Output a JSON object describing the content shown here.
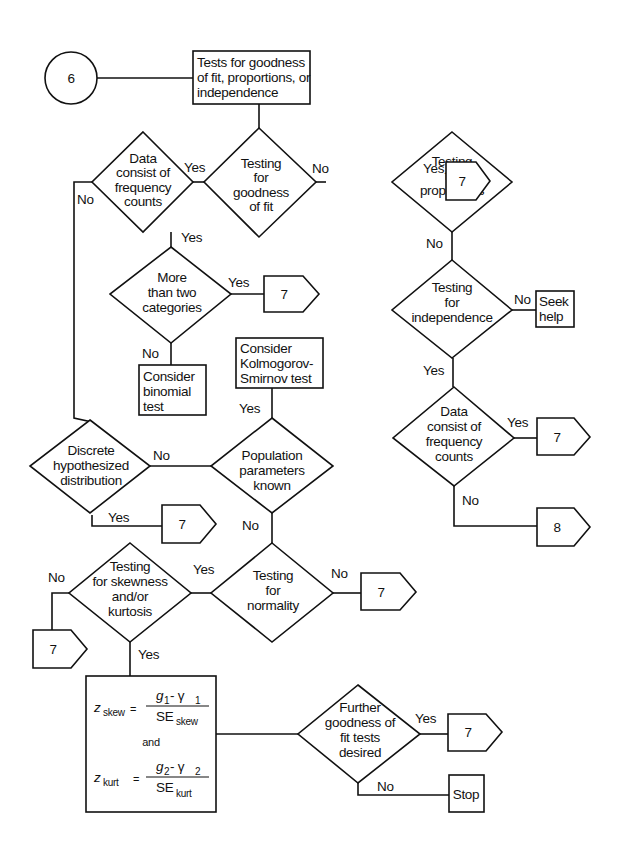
{
  "diagram": {
    "start_connector": {
      "label": "6"
    },
    "title_box": {
      "lines": [
        "Tests for goodness",
        "of fit, proportions, or",
        "independence"
      ]
    },
    "nodes": {
      "goodness_of_fit": {
        "lines": [
          "Testing",
          "for",
          "goodness",
          "of fit"
        ]
      },
      "freq_counts_left": {
        "lines": [
          "Data",
          "consist of",
          "frequency",
          "counts"
        ]
      },
      "proportions": {
        "lines": [
          "Testing",
          "for",
          "proportions"
        ]
      },
      "more_than_two": {
        "lines": [
          "More",
          "than two",
          "categories"
        ]
      },
      "binomial": {
        "lines": [
          "Consider",
          "binomial",
          "test"
        ]
      },
      "ks_test": {
        "lines": [
          "Consider",
          "Kolmogorov-",
          "Smirnov test"
        ]
      },
      "population_known": {
        "lines": [
          "Population",
          "parameters",
          "known"
        ]
      },
      "discrete": {
        "lines": [
          "Discrete",
          "hypothesized",
          "distribution"
        ]
      },
      "independence": {
        "lines": [
          "Testing",
          "for",
          "independence"
        ]
      },
      "seek_help": {
        "lines": [
          "Seek",
          "help"
        ]
      },
      "freq_counts_right": {
        "lines": [
          "Data",
          "consist of",
          "frequency",
          "counts"
        ]
      },
      "normality": {
        "lines": [
          "Testing",
          "for",
          "normality"
        ]
      },
      "skew_kurt": {
        "lines": [
          "Testing",
          "for skewness",
          "and/or",
          "kurtosis"
        ]
      },
      "formula": {
        "z_skew": {
          "lhs": "z",
          "lhs_sub": "skew",
          "num": "g",
          "num_sub": "1",
          "num_rest": " - γ",
          "num_rest_sub": "1",
          "den": "SE",
          "den_sub": "skew"
        },
        "and": "and",
        "z_kurt": {
          "lhs": "z",
          "lhs_sub": "kurt",
          "num": "g",
          "num_sub": "2",
          "num_rest": " - γ",
          "num_rest_sub": "2",
          "den": "SE",
          "den_sub": "kurt"
        }
      },
      "further_tests": {
        "lines": [
          "Further",
          "goodness of",
          "fit tests",
          "desired"
        ]
      },
      "stop": {
        "label": "Stop"
      }
    },
    "offpage_connectors": {
      "c_prop_yes": "7",
      "c_more_yes": "7",
      "c_discrete_yes": "7",
      "c_freq_right_yes": "7",
      "c_freq_right_no": "8",
      "c_normality_no": "7",
      "c_skew_no": "7",
      "c_further_yes": "7"
    },
    "edge_labels": {
      "gof_yes": "Yes",
      "gof_no": "No",
      "freq_left_no": "No",
      "freq_left_yes": "Yes",
      "prop_yes": "Yes",
      "prop_no": "No",
      "more_yes": "Yes",
      "more_no": "No",
      "ks_yes": "Yes",
      "pop_no_left": "No",
      "pop_no_down": "No",
      "discrete_yes": "Yes",
      "indep_no": "No",
      "indep_yes": "Yes",
      "freq_right_yes": "Yes",
      "freq_right_no": "No",
      "norm_yes": "Yes",
      "norm_no": "No",
      "skew_no": "No",
      "skew_yes": "Yes",
      "further_yes": "Yes",
      "further_no": "No"
    }
  }
}
